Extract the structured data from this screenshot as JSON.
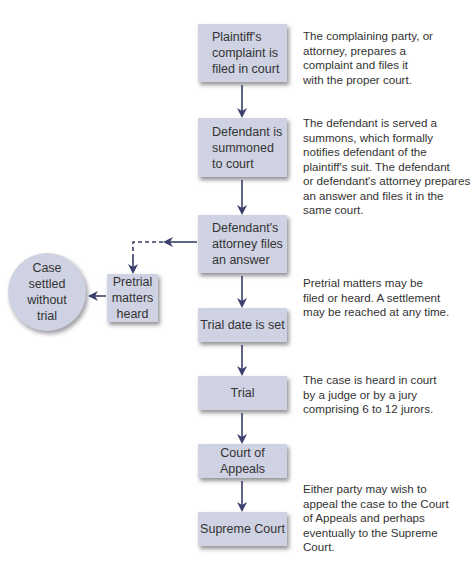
{
  "diagram": {
    "type": "flowchart",
    "colors": {
      "box_fill": "#cfd2e2",
      "arrow": "#3a3f6b",
      "text": "#333333"
    },
    "steps": [
      {
        "id": "complaint",
        "label": "Plaintiff's\ncomplaint is\nfiled in court"
      },
      {
        "id": "summoned",
        "label": "Defendant is\nsummoned\nto court"
      },
      {
        "id": "answer",
        "label": "Defendant's\nattorney files\nan answer"
      },
      {
        "id": "trial_date",
        "label": "Trial date is set"
      },
      {
        "id": "trial",
        "label": "Trial"
      },
      {
        "id": "appeals",
        "label": "Court of Appeals"
      },
      {
        "id": "supreme",
        "label": "Supreme Court"
      }
    ],
    "side_branch": {
      "pretrial": "Pretrial\nmatters\nheard",
      "settled": "Case\nsettled\nwithout\ntrial"
    },
    "descriptions": [
      "The complaining party, or\nattorney, prepares a\ncomplaint and files it\nwith the proper court.",
      "The defendant is served a\nsummons, which formally\nnotifies defendant of the\nplaintiff's suit. The defendant\nor defendant's attorney prepares\nan answer and files it in the\nsame court.",
      "Pretrial matters may be\nfiled or heard. A settlement\nmay be reached at any time.",
      "The case is heard in court\nby a judge or by a jury\ncomprising 6 to 12 jurors.",
      "Either party may wish to\nappeal the case to the Court\nof Appeals and perhaps\neventually to the Supreme\nCourt."
    ],
    "edges": [
      [
        "complaint",
        "summoned"
      ],
      [
        "summoned",
        "answer"
      ],
      [
        "answer",
        "trial_date"
      ],
      [
        "trial_date",
        "trial"
      ],
      [
        "trial",
        "appeals"
      ],
      [
        "appeals",
        "supreme"
      ],
      [
        "answer",
        "pretrial",
        "dashed"
      ],
      [
        "pretrial",
        "settled"
      ]
    ]
  }
}
